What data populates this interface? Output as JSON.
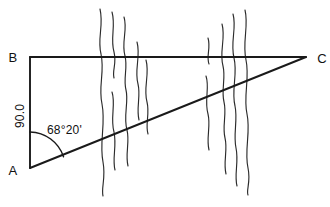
{
  "figure": {
    "background_color": "#ffffff",
    "line_color": "#1a1a1a",
    "grass_color": "#2b2b2b",
    "width": 330,
    "height": 207
  },
  "vertices": {
    "a": {
      "label": "A",
      "x": 30,
      "y": 168,
      "label_x": 13,
      "label_y": 175
    },
    "b": {
      "label": "B",
      "x": 30,
      "y": 57,
      "label_x": 13,
      "label_y": 62
    },
    "c": {
      "label": "C",
      "x": 306,
      "y": 57,
      "label_x": 313,
      "label_y": 63
    }
  },
  "measurements": {
    "side_ab": {
      "label": "90.0",
      "name": "side-ab-length",
      "x": 24,
      "y": 116,
      "rotation": -90
    },
    "angle_a": {
      "label": "68°20'",
      "name": "angle-a-measure",
      "degrees": 68,
      "minutes": 20,
      "x": 47,
      "y": 134
    }
  },
  "edges": [
    {
      "name": "edge-ab",
      "from": "A",
      "to": "B"
    },
    {
      "name": "edge-bc",
      "from": "B",
      "to": "C"
    },
    {
      "name": "edge-ac",
      "from": "A",
      "to": "C"
    }
  ],
  "angle_arc": {
    "name": "angle-arc-at-a",
    "center_x": 30,
    "center_y": 168,
    "radius": 36,
    "path": "M 30 132 A 36 36 0 0 1 63.5 156.7"
  },
  "grass_clusters": [
    {
      "name": "grass-cluster-left",
      "strokes": [
        "M 100 9 C 104 26 97 38 101 54 C 105 72 98 86 102 104 C 106 124 99 142 103 162 C 106 178 101 188 103 196",
        "M 112 12 C 116 26 110 38 114 52 C 117 64 112 70 114 78",
        "M 112 92 C 116 104 110 118 114 132 C 117 146 112 158 115 170",
        "M 124 17 C 128 30 121 42 125 56 C 128 68 123 78 126 90 C 129 102 123 116 127 130 C 130 142 125 154 128 166",
        "M 137 42 C 141 56 134 70 138 84 C 141 96 136 108 139 120",
        "M 146 60 C 150 74 143 88 147 102 C 150 114 145 124 148 134"
      ]
    },
    {
      "name": "grass-cluster-right",
      "strokes": [
        "M 208 38 C 211 48 206 56 209 64",
        "M 206 76 C 210 88 204 100 208 114 C 211 126 206 138 209 150",
        "M 222 24 C 226 38 219 52 223 66 C 226 78 221 90 224 102 C 227 114 222 126 225 138 C 228 150 223 162 226 174",
        "M 233 14 C 237 28 230 42 234 58 C 238 74 231 90 235 106 C 238 120 233 134 236 148 C 239 162 234 174 237 186",
        "M 245 10 C 249 26 242 42 246 60 C 250 78 243 96 247 114 C 251 132 244 150 248 168 C 251 182 246 190 248 195"
      ]
    }
  ]
}
